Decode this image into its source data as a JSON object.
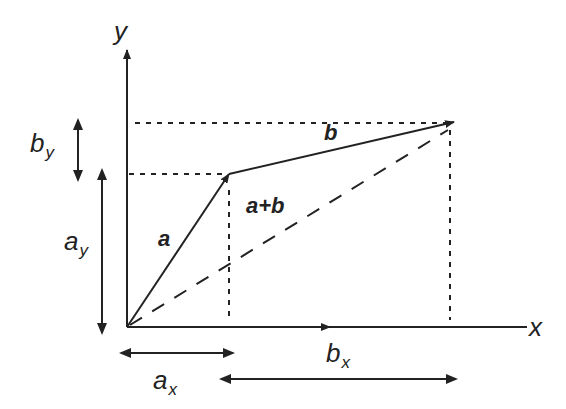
{
  "diagram": {
    "axes": {
      "x_label": "x",
      "y_label": "y"
    },
    "vectors": [
      {
        "name": "a",
        "label": "a",
        "style": "solid"
      },
      {
        "name": "b",
        "label": "b",
        "style": "solid"
      },
      {
        "name": "sum",
        "label": "a+b",
        "style": "dashed"
      }
    ],
    "components": {
      "ax": {
        "base": "a",
        "sub": "x"
      },
      "ay": {
        "base": "a",
        "sub": "y"
      },
      "bx": {
        "base": "b",
        "sub": "x"
      },
      "by": {
        "base": "b",
        "sub": "y"
      }
    },
    "colors": {
      "ink": "#222222",
      "background": "#ffffff"
    }
  }
}
